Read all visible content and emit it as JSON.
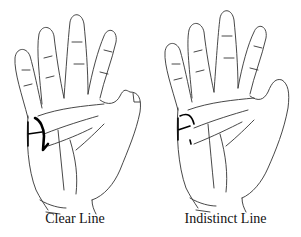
{
  "figures": [
    {
      "id": "clear",
      "caption": "Clear Line",
      "icon": "palm-hand-illustration"
    },
    {
      "id": "indistinct",
      "caption": "Indistinct Line",
      "icon": "palm-hand-illustration"
    }
  ],
  "colors": {
    "background": "#ffffff",
    "ink": "#000000"
  }
}
